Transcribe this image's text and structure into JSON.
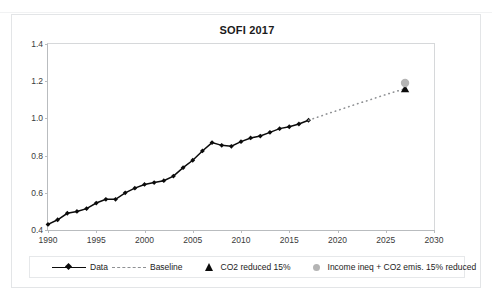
{
  "top_strip": {
    "left_ghost": "· ·",
    "right_ghost": "·   ·   ·"
  },
  "chart_data": {
    "type": "line",
    "title": "SOFI 2017",
    "xlabel": "",
    "ylabel": "",
    "xlim": [
      1990,
      2030
    ],
    "ylim": [
      0.4,
      1.4
    ],
    "xticks": [
      1990,
      1995,
      2000,
      2005,
      2010,
      2015,
      2020,
      2025,
      2030
    ],
    "yticks": [
      0.4,
      0.6,
      0.8,
      1.0,
      1.2,
      1.4
    ],
    "ytick_labels": [
      "0.4",
      "0.6",
      "0.8",
      "1.0",
      "1.2",
      "1.4"
    ],
    "xtick_labels": [
      "1990",
      "1995",
      "2000",
      "2005",
      "2010",
      "2015",
      "2020",
      "2025",
      "2030"
    ],
    "grid": false,
    "legend_position": "bottom",
    "colors": {
      "data": "#0b0b0b",
      "baseline": "#8f9194",
      "co2_marker": "#0b0b0b",
      "income_marker": "#b4b4b4",
      "axis": "#b9bcbf",
      "text": "#1b1b1b"
    },
    "series": [
      {
        "name": "Data",
        "style": "solid-line-diamond-markers",
        "x": [
          1990,
          1991,
          1992,
          1993,
          1994,
          1995,
          1996,
          1997,
          1998,
          1999,
          2000,
          2001,
          2002,
          2003,
          2004,
          2005,
          2006,
          2007,
          2008,
          2009,
          2010,
          2011,
          2012,
          2013,
          2014,
          2015,
          2016,
          2017
        ],
        "values": [
          0.43,
          0.455,
          0.49,
          0.5,
          0.515,
          0.545,
          0.565,
          0.565,
          0.6,
          0.625,
          0.645,
          0.655,
          0.665,
          0.69,
          0.735,
          0.775,
          0.825,
          0.87,
          0.855,
          0.85,
          0.875,
          0.895,
          0.905,
          0.925,
          0.945,
          0.955,
          0.97,
          0.99
        ]
      },
      {
        "name": "Baseline",
        "style": "dotted-line",
        "x": [
          2017,
          2018,
          2019,
          2020,
          2021,
          2022,
          2023,
          2024,
          2025,
          2026,
          2027
        ],
        "values": [
          0.99,
          1.008,
          1.026,
          1.043,
          1.06,
          1.078,
          1.094,
          1.111,
          1.128,
          1.144,
          1.16
        ]
      },
      {
        "name": "CO2 reduced 15%",
        "style": "triangle-marker",
        "x": [
          2027
        ],
        "values": [
          1.16
        ]
      },
      {
        "name": "Income ineq + CO2 emis. 15% reduced",
        "style": "circle-marker",
        "x": [
          2027
        ],
        "values": [
          1.19
        ]
      }
    ],
    "legend": [
      {
        "label": "Data",
        "marker": "line-diamond"
      },
      {
        "label": "Baseline",
        "marker": "dashed-line"
      },
      {
        "label": "CO2 reduced 15%",
        "marker": "triangle"
      },
      {
        "label": "Income ineq + CO2 emis. 15% reduced",
        "marker": "circle"
      }
    ]
  }
}
